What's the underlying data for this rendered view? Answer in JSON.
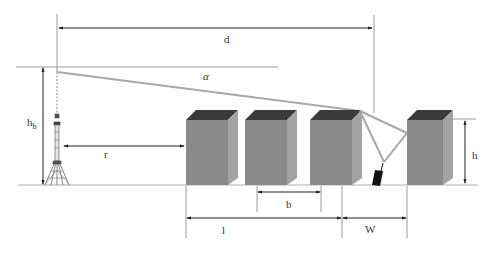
{
  "diagram": {
    "colors": {
      "background": "#ffffff",
      "building_front": "#8a8a8a",
      "building_side": "#a3a3a3",
      "building_top": "#3b3b3b",
      "ray": "#a8a8a8",
      "dim_line": "#222222",
      "ref_line": "#9a9a9a",
      "ground": "#b0b0b0",
      "mobile": "#111111"
    },
    "labels": {
      "d": "d",
      "alpha": "α",
      "hb": "h",
      "hb_sub": "b",
      "r": "r",
      "h": "h",
      "b": "b",
      "l": "l",
      "w": "W"
    },
    "ground_y": 185,
    "tower": {
      "x": 57,
      "top_y": 71,
      "base_y": 185
    },
    "buildings": [
      {
        "name": "building-1",
        "x": 186,
        "y": 120,
        "w": 42,
        "h": 65,
        "side": 10,
        "roof": 10
      },
      {
        "name": "building-2",
        "x": 245,
        "y": 120,
        "w": 42,
        "h": 65,
        "side": 10,
        "roof": 10
      },
      {
        "name": "building-3",
        "x": 310,
        "y": 120,
        "w": 42,
        "h": 65,
        "side": 10,
        "roof": 10
      },
      {
        "name": "building-4",
        "x": 407,
        "y": 120,
        "w": 36,
        "h": 65,
        "side": 10,
        "roof": 10
      }
    ]
  }
}
